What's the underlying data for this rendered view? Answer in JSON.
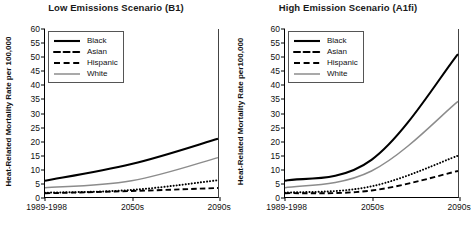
{
  "figure": {
    "panels": [
      {
        "title": "Low Emissions Scenario (B1)",
        "ylabel": "Heat-Related Mortality Rate per 100,000"
      },
      {
        "title": "High Emission Scenario (A1fi)",
        "ylabel": "Heat-Related Mortality Rate per100,000"
      }
    ],
    "legend": {
      "items": [
        {
          "label": "Black",
          "style": "solid-thick",
          "color": "#000000"
        },
        {
          "label": "Asian",
          "style": "dotted",
          "color": "#000000"
        },
        {
          "label": "Hispanic",
          "style": "dashed",
          "color": "#000000"
        },
        {
          "label": "White",
          "style": "solid-gray",
          "color": "#8c8c8c"
        }
      ]
    },
    "yticks": [
      "0",
      "5",
      "10",
      "15",
      "20",
      "25",
      "30",
      "35",
      "40",
      "45",
      "50",
      "55",
      "60"
    ],
    "xticks": [
      "1989-1998",
      "2050s",
      "2090s"
    ]
  },
  "chart_data": [
    {
      "type": "line",
      "title": "Low Emissions Scenario (B1)",
      "xlabel": "",
      "ylabel": "Heat-Related Mortality Rate per 100,000",
      "categories": [
        "1989-1998",
        "2050s",
        "2090s"
      ],
      "ylim": [
        0,
        60
      ],
      "ytick_step": 5,
      "grid": false,
      "legend_position": "top-left",
      "series": [
        {
          "name": "Black",
          "values": [
            5.5,
            11.5,
            20.6
          ],
          "style": "solid-thick",
          "color": "#000000"
        },
        {
          "name": "Asian",
          "values": [
            1.2,
            2.2,
            5.7
          ],
          "style": "dotted",
          "color": "#000000"
        },
        {
          "name": "Hispanic",
          "values": [
            1.0,
            1.8,
            2.9
          ],
          "style": "dashed",
          "color": "#000000"
        },
        {
          "name": "White",
          "values": [
            3.0,
            5.5,
            13.8
          ],
          "style": "solid-gray",
          "color": "#8c8c8c"
        }
      ]
    },
    {
      "type": "line",
      "title": "High Emission Scenario (A1fi)",
      "xlabel": "",
      "ylabel": "Heat-Related Mortality Rate per100,000",
      "categories": [
        "1989-1998",
        "2050s",
        "2090s"
      ],
      "ylim": [
        0,
        60
      ],
      "ytick_step": 5,
      "grid": false,
      "legend_position": "top-left",
      "series": [
        {
          "name": "Black",
          "values": [
            5.5,
            13.0,
            51.0
          ],
          "style": "solid-thick",
          "color": "#000000"
        },
        {
          "name": "Asian",
          "values": [
            1.2,
            3.5,
            14.5
          ],
          "style": "dotted",
          "color": "#000000"
        },
        {
          "name": "Hispanic",
          "values": [
            1.0,
            2.0,
            9.0
          ],
          "style": "dashed",
          "color": "#000000"
        },
        {
          "name": "White",
          "values": [
            3.0,
            9.0,
            34.0
          ],
          "style": "solid-gray",
          "color": "#8c8c8c"
        }
      ]
    }
  ]
}
